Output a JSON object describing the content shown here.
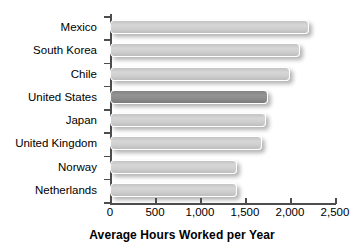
{
  "chart_data": {
    "type": "bar",
    "orientation": "horizontal",
    "title": "",
    "xlabel": "Average Hours Worked per Year",
    "ylabel": "",
    "categories": [
      "Mexico",
      "South Korea",
      "Chile",
      "United States",
      "Japan",
      "United Kingdom",
      "Norway",
      "Netherlands"
    ],
    "values": [
      2210,
      2110,
      2000,
      1760,
      1730,
      1690,
      1410,
      1410
    ],
    "xlim": [
      0,
      2500
    ],
    "xticks": [
      0,
      500,
      1000,
      1500,
      2000,
      2500
    ],
    "xtick_labels": [
      "0",
      "500",
      "1,000",
      "1,500",
      "2,000",
      "2,500"
    ],
    "grid": false,
    "legend": "none",
    "highlight_category": "United States",
    "series": [
      {
        "name": "Average Hours Worked per Year",
        "values": [
          2210,
          2110,
          2000,
          1760,
          1730,
          1690,
          1410,
          1410
        ]
      }
    ],
    "bars": [
      {
        "label": "Mexico",
        "value": 2210,
        "highlight": false
      },
      {
        "label": "South Korea",
        "value": 2110,
        "highlight": false
      },
      {
        "label": "Chile",
        "value": 2000,
        "highlight": false
      },
      {
        "label": "United States",
        "value": 1760,
        "highlight": true
      },
      {
        "label": "Japan",
        "value": 1730,
        "highlight": false
      },
      {
        "label": "United Kingdom",
        "value": 1690,
        "highlight": false
      },
      {
        "label": "Norway",
        "value": 1410,
        "highlight": false
      },
      {
        "label": "Netherlands",
        "value": 1410,
        "highlight": false
      }
    ],
    "colors": {
      "bar": "#cfcfcf",
      "bar_highlight": "#8c8c8c",
      "axis": "#4d4d4d",
      "text": "#000000",
      "background": "#ffffff"
    }
  }
}
